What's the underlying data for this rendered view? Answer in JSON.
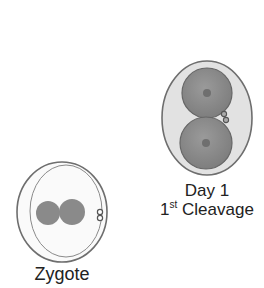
{
  "stages": [
    {
      "id": "zygote",
      "label": "Zygote"
    },
    {
      "id": "day1",
      "label_line1": "Day 1",
      "label_line2_num": "1",
      "label_line2_sup": "st",
      "label_line2_text": " Cleavage"
    }
  ],
  "colors": {
    "outline": "#6e6e6e",
    "zona_fill": "#e6e6e6",
    "cell_fill": "#8a8a8a",
    "nucleus": "#6f6f6f",
    "text": "#222222"
  }
}
